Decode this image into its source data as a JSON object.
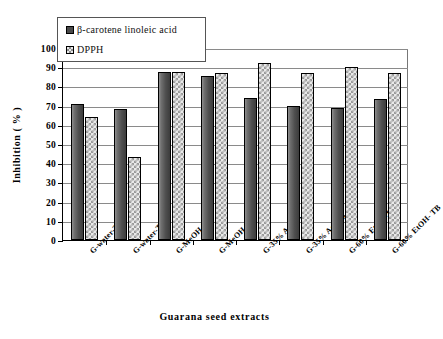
{
  "chart_data": {
    "type": "bar",
    "title": "",
    "xlabel": "Guarana seed extracts",
    "ylabel": "Inhibition ( % )",
    "ylim": [
      0,
      100
    ],
    "ytick_values": [
      0,
      10,
      20,
      30,
      40,
      50,
      60,
      70,
      80,
      90,
      100
    ],
    "ytick_labels": [
      "0",
      "10",
      "20",
      "30",
      "40",
      "50",
      "60",
      "70",
      "80",
      "90",
      "100"
    ],
    "grid": true,
    "legend_position": "top-left",
    "categories": [
      "G-water-TR",
      "G-water-TB",
      "G-MeOH-TR",
      "G-MeOH-TB",
      "G-35% Ac-TR",
      "G-35% Ac- TB",
      "G-60% EtOH-TR",
      "G-60% EtOH- TB"
    ],
    "series": [
      {
        "name": "β-carotene linoleic acid",
        "color": "#4a4a4a",
        "values": [
          71,
          68,
          87.5,
          85.5,
          74,
          70,
          69,
          73.5
        ]
      },
      {
        "name": "DPPH",
        "color": "#e9e9e9",
        "values": [
          64,
          43,
          87.5,
          87,
          92,
          87,
          90,
          87
        ]
      }
    ]
  },
  "legend": {
    "items": [
      {
        "label": "β-carotene linoleic acid"
      },
      {
        "label": "DPPH"
      }
    ]
  }
}
